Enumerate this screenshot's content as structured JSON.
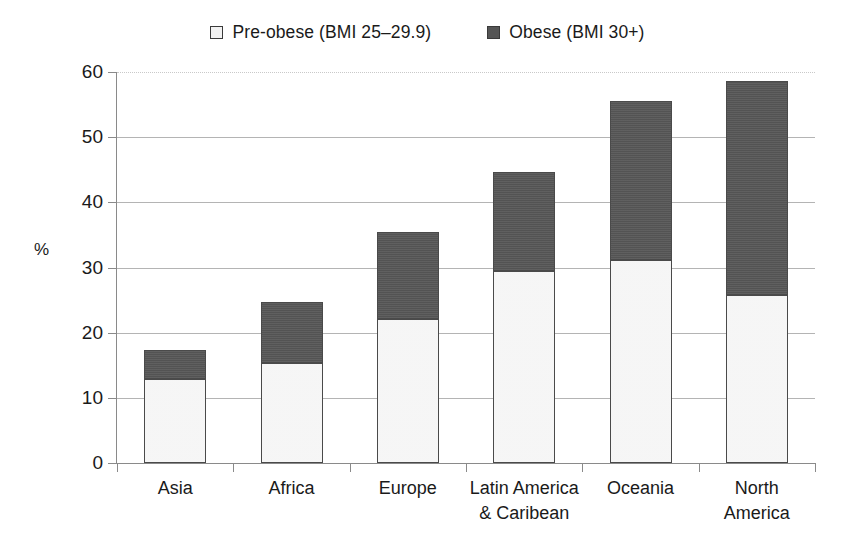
{
  "chart_data": {
    "type": "bar",
    "subtype": "stacked",
    "title": "",
    "xlabel": "",
    "ylabel": "%",
    "ylim": [
      0,
      60
    ],
    "ytick_step": 10,
    "yticks": [
      "60",
      "50",
      "40",
      "30",
      "20",
      "10",
      "0"
    ],
    "grid": true,
    "legend_position": "top-center",
    "categories": [
      "Asia",
      "Africa",
      "Europe",
      "Latin America\n& Caribean",
      "Oceania",
      "North\nAmerica"
    ],
    "series": [
      {
        "name": "Pre-obese (BMI 25–29.9)",
        "color": "#eeeeee",
        "values": [
          12.9,
          15.4,
          22.1,
          29.4,
          31.1,
          25.8
        ]
      },
      {
        "name": "Obese (BMI 30+)",
        "color": "#575757",
        "values": [
          4.5,
          9.3,
          13.3,
          15.2,
          24.5,
          32.8
        ]
      }
    ],
    "totals": [
      17.4,
      24.7,
      35.4,
      44.6,
      55.6,
      58.6
    ]
  },
  "legend": {
    "items": [
      {
        "label": "Pre-obese (BMI 25–29.9)",
        "swatch": "light-square-icon"
      },
      {
        "label": "Obese (BMI 30+)",
        "swatch": "dark-square-icon"
      }
    ]
  },
  "colors": {
    "preobese": "#eeeeee",
    "obese": "#575757",
    "grid": "#b4b4b4",
    "axis": "#8a8a8a",
    "text": "#1a1a1a"
  }
}
